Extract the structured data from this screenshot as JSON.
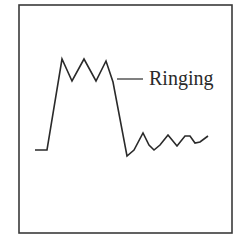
{
  "diagram": {
    "title": "",
    "annotation": {
      "label": "Ringing"
    },
    "colors": {
      "stroke": "#2a2a2a",
      "frame": "#3a3a3a",
      "background": "#ffffff"
    },
    "frame": {
      "x": 19,
      "y": 5,
      "width": 213,
      "height": 228
    },
    "waveform_points": [
      [
        35,
        150
      ],
      [
        47,
        150
      ],
      [
        62,
        59
      ],
      [
        72,
        81
      ],
      [
        84,
        59
      ],
      [
        96,
        81
      ],
      [
        106,
        61
      ],
      [
        113,
        82
      ],
      [
        127,
        156
      ],
      [
        134,
        150
      ],
      [
        143,
        133
      ],
      [
        149,
        145
      ],
      [
        154,
        150
      ],
      [
        160,
        145
      ],
      [
        168,
        135
      ],
      [
        177,
        146
      ],
      [
        185,
        136
      ],
      [
        190,
        136
      ],
      [
        195,
        143
      ],
      [
        200,
        142
      ],
      [
        208,
        136
      ]
    ],
    "leader_line": {
      "x1": 117,
      "y1": 79,
      "x2": 143,
      "y2": 79
    }
  }
}
